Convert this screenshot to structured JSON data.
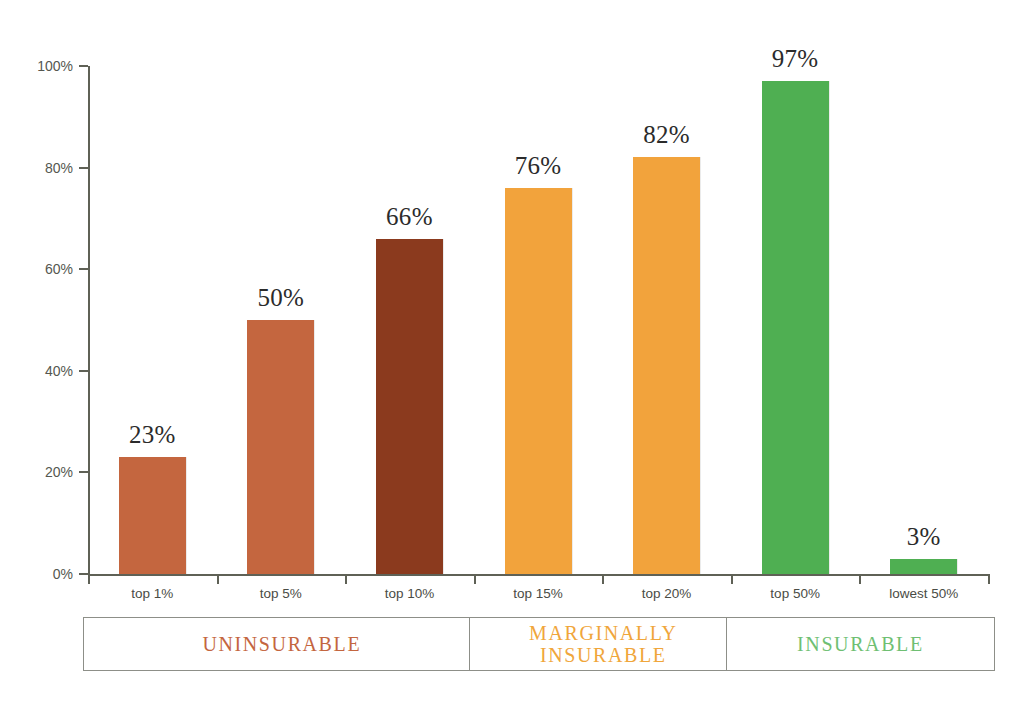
{
  "chart_data": {
    "type": "bar",
    "title": "",
    "subtitle": "",
    "xlabel": "",
    "ylabel": "",
    "ylim": [
      0,
      100
    ],
    "grid": false,
    "legend_position": "bottom",
    "categories": [
      "top 1%",
      "top 5%",
      "top 10%",
      "top 15%",
      "top 20%",
      "top 50%",
      "lowest 50%"
    ],
    "values": [
      23,
      50,
      66,
      76,
      82,
      97,
      3
    ],
    "value_labels": [
      "23%",
      "50%",
      "66%",
      "76%",
      "82%",
      "97%",
      "3%"
    ],
    "bar_colors": [
      "#C4663F",
      "#C4663F",
      "#8B3A1E",
      "#F2A33C",
      "#F2A33C",
      "#4FAF52",
      "#4FAF52"
    ],
    "y_ticks": [
      0,
      20,
      40,
      60,
      80,
      100
    ],
    "y_tick_labels": [
      "0%",
      "20%",
      "40%",
      "60%",
      "80%",
      "100%"
    ],
    "legend": [
      {
        "label": "UNINSURABLE",
        "color": "#C4663F",
        "covers": [
          "top 1%",
          "top 5%",
          "top 10%"
        ]
      },
      {
        "label": "MARGINALLY\nINSURABLE",
        "color": "#F0A63B",
        "covers": [
          "top 15%",
          "top 20%"
        ]
      },
      {
        "label": "INSURABLE",
        "color": "#6FBF73",
        "covers": [
          "top 50%",
          "lowest 50%"
        ]
      }
    ]
  },
  "colors": {
    "axis": "#5f6156",
    "tick_text": "#555750",
    "value_text": "#2b2b2b",
    "category_text": "#4a4c45",
    "legend_border": "#8d8f88",
    "background": "#ffffff"
  }
}
